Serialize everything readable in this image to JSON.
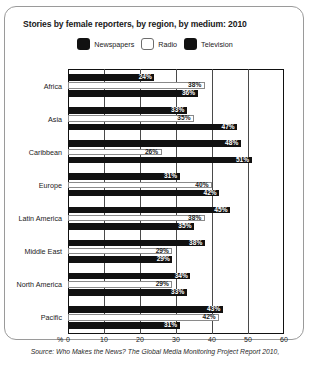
{
  "title": "Stories by female reporters, by region, by medium: 2010",
  "source": "Source: Who Makes the News? The Global Media Monitoring Project Report 2010,",
  "legend": [
    {
      "label": "Newspapers",
      "swatch": "dark-square-icon"
    },
    {
      "label": "Radio",
      "swatch": "light-square-icon"
    },
    {
      "label": "Television",
      "swatch": "dark-square-icon"
    }
  ],
  "axis": {
    "unit": "%",
    "ticks": [
      "0",
      "10",
      "20",
      "30",
      "40",
      "50",
      "60"
    ]
  },
  "chart_data": {
    "type": "bar",
    "orientation": "horizontal",
    "title": "Stories by female reporters, by region, by medium: 2010",
    "xlabel": "%",
    "ylabel": "",
    "xlim": [
      0,
      60
    ],
    "grid": true,
    "legend_position": "top-center",
    "categories": [
      "Africa",
      "Asia",
      "Caribbean",
      "Europe",
      "Latin America",
      "Middle East",
      "North America",
      "Pacific"
    ],
    "series": [
      {
        "name": "Newspapers",
        "color": "#111111",
        "values": [
          24,
          33,
          48,
          31,
          45,
          38,
          34,
          43
        ]
      },
      {
        "name": "Radio",
        "color": "#ffffff",
        "values": [
          38,
          35,
          26,
          40,
          38,
          29,
          29,
          42
        ]
      },
      {
        "name": "Television",
        "color": "#111111",
        "values": [
          36,
          47,
          51,
          42,
          35,
          29,
          33,
          31
        ]
      }
    ],
    "data_labels": [
      {
        "region": "Africa",
        "Newspapers": "24%",
        "Radio": "38%",
        "Television": "36%"
      },
      {
        "region": "Asia",
        "Newspapers": "33%",
        "Radio": "35%",
        "Television": "47%"
      },
      {
        "region": "Caribbean",
        "Newspapers": "48%",
        "Radio": "26%",
        "Television": "51%"
      },
      {
        "region": "Europe",
        "Newspapers": "31%",
        "Radio": "40%",
        "Television": "42%"
      },
      {
        "region": "Latin America",
        "Newspapers": "45%",
        "Radio": "38%",
        "Television": "35%"
      },
      {
        "region": "Middle East",
        "Newspapers": "38%",
        "Radio": "29%",
        "Television": "29%"
      },
      {
        "region": "North America",
        "Newspapers": "34%",
        "Radio": "29%",
        "Television": "33%"
      },
      {
        "region": "Pacific",
        "Newspapers": "43%",
        "Radio": "42%",
        "Television": "31%"
      }
    ]
  }
}
